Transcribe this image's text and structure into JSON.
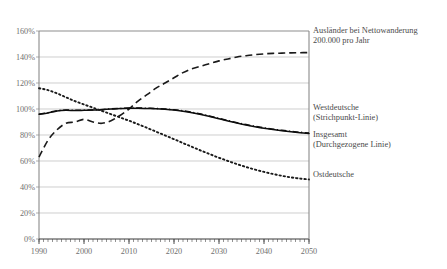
{
  "chart_data": {
    "type": "line",
    "title": "",
    "subtitle": "",
    "xlabel": "",
    "ylabel": "",
    "xlim": [
      1990,
      2050
    ],
    "ylim": [
      0,
      160
    ],
    "grid": true,
    "legend_position": "right-inline",
    "y_tick_labels": [
      "160%",
      "140%",
      "120%",
      "100%",
      "80%",
      "60%",
      "40%",
      "20%",
      "0%"
    ],
    "y_ticks": [
      160,
      140,
      120,
      100,
      80,
      60,
      40,
      20,
      0
    ],
    "x_tick_labels": [
      "1990",
      "2000",
      "2010",
      "2020",
      "2030",
      "2040",
      "2050"
    ],
    "x_ticks": [
      1990,
      2000,
      2010,
      2020,
      2030,
      2040,
      2050
    ],
    "x_minor_tick_interval": 1,
    "x": [
      1990,
      1992,
      1994,
      1996,
      1998,
      2000,
      2002,
      2004,
      2006,
      2008,
      2010,
      2012,
      2014,
      2016,
      2018,
      2020,
      2022,
      2024,
      2026,
      2028,
      2030,
      2032,
      2034,
      2036,
      2038,
      2040,
      2042,
      2044,
      2046,
      2048,
      2050
    ],
    "series": [
      {
        "name": "Ausländer bei Nettowanderung 200.000 pro Jahr",
        "style": "dashed",
        "color": "#1a1a1a",
        "values": [
          63,
          76,
          84,
          89,
          90,
          92,
          90,
          89,
          91,
          95,
          100,
          106,
          111,
          116,
          120,
          124,
          128,
          131,
          133,
          135,
          137,
          138.5,
          140,
          141,
          141.8,
          142.4,
          142.8,
          143,
          143.2,
          143.3,
          143.4
        ]
      },
      {
        "name": "Insgesamt (Durchgezogene Linie)",
        "style": "solid",
        "color": "#0d0d0d",
        "values": [
          96,
          97,
          98.5,
          99,
          98.8,
          99,
          99.2,
          99.5,
          100,
          100.3,
          100.6,
          100.6,
          100.4,
          100.2,
          99.8,
          99.2,
          98.3,
          97.2,
          95.8,
          94.2,
          92.5,
          90.8,
          89.2,
          87.7,
          86.4,
          85.2,
          84.2,
          83.3,
          82.5,
          81.8,
          81.2
        ]
      },
      {
        "name": "Westdeutsche (Strichpunkt-Linie)",
        "style": "dash-dot",
        "color": "#0d0d0d",
        "values": [
          96,
          97.2,
          98.7,
          99.2,
          99,
          99.1,
          99.3,
          99.6,
          100.1,
          100.4,
          100.7,
          100.8,
          100.6,
          100.4,
          100,
          99.4,
          98.6,
          97.5,
          96.1,
          94.5,
          92.8,
          91.1,
          89.5,
          88,
          86.7,
          85.5,
          84.5,
          83.6,
          82.8,
          82.1,
          81.5
        ]
      },
      {
        "name": "Ostdeutsche",
        "style": "dotted",
        "color": "#1a1a1a",
        "values": [
          116,
          114.5,
          112,
          109,
          106,
          103.5,
          101,
          98.5,
          96,
          93.5,
          91,
          88.3,
          85.5,
          82.6,
          79.7,
          76.8,
          73.8,
          70.9,
          68,
          65.2,
          62.5,
          60,
          57.6,
          55.4,
          53.4,
          51.6,
          50,
          48.6,
          47.4,
          46.5,
          45.8
        ]
      }
    ],
    "annotations": [
      {
        "id": "auslaender",
        "text": "Ausländer bei Nettowanderung\n200.000 pro Jahr"
      },
      {
        "id": "west",
        "text": "Westdeutsche\n(Strichpunkt-Linie)"
      },
      {
        "id": "insgesamt",
        "text": "Insgesamt\n(Durchgezogene Linie)"
      },
      {
        "id": "ost",
        "text": "Ostdeutsche"
      }
    ]
  },
  "source_note": ""
}
